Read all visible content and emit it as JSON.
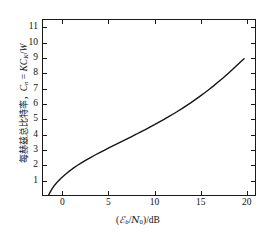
{
  "chart_data": {
    "type": "line",
    "title": "",
    "subtitle": "",
    "xlabel": "(ℰb/N0)/dB",
    "xlabel_parts": {
      "open": "(",
      "numerator": "ℰ",
      "numerator_sub": "b",
      "slash": "/",
      "denominator": "N",
      "denominator_sub": "0",
      "close": ")",
      "unit_divider": "/",
      "unit": "dB"
    },
    "ylabel": "每赫兹总比特率，Cn = KCK/W",
    "ylabel_parts": {
      "cjk": "每赫兹总比特率，",
      "symbol": "C",
      "symbol_sub": "n",
      "equals": " = ",
      "expr_k": "K",
      "expr_c": "C",
      "expr_c_sub": "K",
      "expr_slash": "/",
      "expr_w": "W"
    },
    "xlim": [
      -2.2,
      21.0
    ],
    "ylim": [
      0.0,
      11.55
    ],
    "xticks": [
      0,
      5,
      10,
      15,
      20
    ],
    "xticklabels": [
      "0",
      "5",
      "10",
      "15",
      "20"
    ],
    "yticks": [
      1,
      2,
      3,
      4,
      5,
      6,
      7,
      8,
      9,
      10,
      11
    ],
    "yticklabels": [
      "1",
      "2",
      "3",
      "4",
      "5",
      "6",
      "7",
      "8",
      "9",
      "10",
      "11"
    ],
    "grid": false,
    "legend": null,
    "legend_position": "none",
    "line_color": "#151515",
    "line_width": 1.4,
    "series": [
      {
        "name": "Shannon capacity bound",
        "x": [
          -1.59,
          -1.4,
          -1.2,
          -1.0,
          -0.6,
          -0.2,
          0.2,
          0.6,
          1.0,
          1.5,
          2.0,
          2.5,
          3.0,
          3.5,
          4.0,
          4.5,
          5.0,
          5.5,
          6.0,
          6.5,
          7.0,
          7.5,
          8.0,
          8.5,
          9.0,
          9.5,
          10.0,
          10.5,
          11.0,
          11.5,
          12.0,
          12.5,
          13.0,
          13.5,
          14.0,
          14.5,
          15.0,
          15.5,
          16.0,
          16.5,
          17.0,
          17.5,
          18.0,
          18.5,
          19.0,
          19.5,
          19.8
        ],
        "y": [
          0.0,
          0.21,
          0.42,
          0.59,
          0.88,
          1.12,
          1.34,
          1.54,
          1.72,
          1.93,
          2.12,
          2.3,
          2.47,
          2.64,
          2.8,
          2.95,
          3.11,
          3.26,
          3.41,
          3.56,
          3.71,
          3.86,
          4.01,
          4.17,
          4.32,
          4.48,
          4.64,
          4.81,
          4.98,
          5.15,
          5.33,
          5.51,
          5.7,
          5.9,
          6.1,
          6.31,
          6.53,
          6.75,
          6.98,
          7.22,
          7.47,
          7.72,
          7.99,
          8.26,
          8.54,
          8.83,
          9.0
        ],
        "color": "#151515"
      }
    ],
    "annotations": [
      {
        "text": "Shannon limit",
        "x": -1.59,
        "y": 0.0,
        "visible": false
      }
    ]
  },
  "figure": {
    "background_color": "#ffffff",
    "axis_color": "#1a1a1a",
    "width_px": 276,
    "height_px": 237
  }
}
